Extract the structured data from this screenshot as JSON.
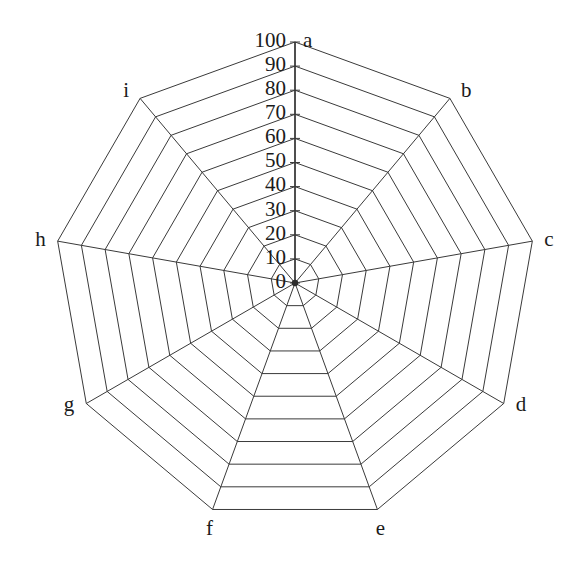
{
  "chart_data": {
    "type": "radar",
    "title": "",
    "subtitle": "",
    "xlabel": "",
    "ylabel": "",
    "categories": [
      "a",
      "b",
      "c",
      "d",
      "e",
      "f",
      "g",
      "h",
      "i"
    ],
    "series": [],
    "radial_axis": {
      "min": 0,
      "max": 100,
      "step": 10,
      "tick_labels": [
        "0",
        "10",
        "20",
        "30",
        "40",
        "50",
        "60",
        "70",
        "80",
        "90",
        "100"
      ],
      "tick_values": [
        0,
        10,
        20,
        30,
        40,
        50,
        60,
        70,
        80,
        90,
        100
      ],
      "label_axis": "a"
    },
    "grid": {
      "rings": 10,
      "shape": "polygon",
      "spokes": 9,
      "visible": true
    },
    "legend": {
      "visible": false,
      "position": "none",
      "entries": []
    },
    "colors": {
      "background": "#ffffff",
      "grid": "#3a3a3a",
      "axis": "#2e2e2e",
      "text": "#1b1b1b"
    }
  },
  "geometry": {
    "center_x": 295,
    "center_y": 283,
    "radius": 241,
    "start_angle_deg": -90,
    "direction": "clockwise"
  },
  "vertex_labels": [
    {
      "key": "a",
      "label": "a",
      "anchor": "start",
      "dx": 8,
      "dy": 0
    },
    {
      "key": "b",
      "label": "b",
      "anchor": "start",
      "dx": 11,
      "dy": -6
    },
    {
      "key": "c",
      "label": "c",
      "anchor": "start",
      "dx": 12,
      "dy": 0
    },
    {
      "key": "d",
      "label": "d",
      "anchor": "start",
      "dx": 12,
      "dy": 3
    },
    {
      "key": "e",
      "label": "e",
      "anchor": "middle",
      "dx": 3,
      "dy": 21
    },
    {
      "key": "f",
      "label": "f",
      "anchor": "middle",
      "dx": -3,
      "dy": 21
    },
    {
      "key": "g",
      "label": "g",
      "anchor": "end",
      "dx": -12,
      "dy": 3
    },
    {
      "key": "h",
      "label": "h",
      "anchor": "end",
      "dx": -12,
      "dy": 0
    },
    {
      "key": "i",
      "label": "i",
      "anchor": "end",
      "dx": -11,
      "dy": -6
    }
  ]
}
